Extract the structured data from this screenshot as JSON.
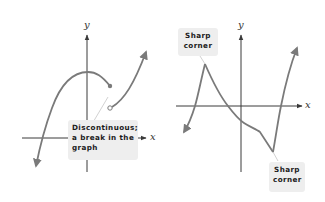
{
  "colors": {
    "axis": "#3a3a3a",
    "curve": "#7a7a7a",
    "callout_bg": "#eeeeee",
    "callout_text": "#1a1a1a",
    "pointer": "#cfcfcf"
  },
  "left_graph": {
    "x_axis_label": "x",
    "y_axis_label": "y",
    "callout": {
      "lines": [
        "Discontinuous;",
        "a break in the",
        "graph"
      ]
    },
    "features": {
      "filled_endpoint": "closed-dot",
      "open_endpoint": "open-circle"
    }
  },
  "right_graph": {
    "x_axis_label": "x",
    "y_axis_label": "y",
    "callout_top": {
      "lines": [
        "Sharp",
        "corner"
      ]
    },
    "callout_bottom": {
      "lines": [
        "Sharp",
        "corner"
      ]
    }
  }
}
